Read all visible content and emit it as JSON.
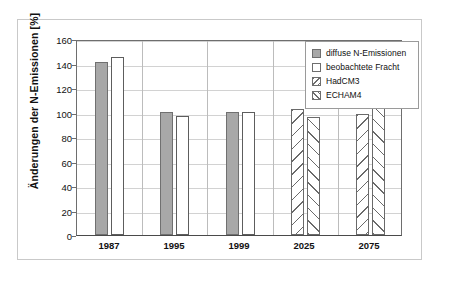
{
  "chart_data": {
    "type": "bar",
    "title": "",
    "xlabel": "",
    "ylabel": "Änderungen der N-Emissionen [%]",
    "categories": [
      "1987",
      "1995",
      "1999",
      "2025",
      "2075"
    ],
    "ylim": [
      0,
      160
    ],
    "yticks": [
      0,
      20,
      40,
      60,
      80,
      100,
      120,
      140,
      160
    ],
    "ytick_labels": [
      "0",
      "20",
      "40",
      "60",
      "80",
      "100",
      "120",
      "140",
      "160"
    ],
    "grid": "horizontal",
    "legend_position": "top-right",
    "series": [
      {
        "name": "diffuse N-Emissionen",
        "style": "solid-gray",
        "color": "#a8a8a8",
        "values": [
          141,
          100,
          100,
          null,
          null
        ]
      },
      {
        "name": "beobachtete Fracht",
        "style": "open-white",
        "color": "#ffffff",
        "values": [
          145,
          97.5,
          100,
          null,
          null
        ]
      },
      {
        "name": "HadCM3",
        "style": "hatch-backslash",
        "color": "#ffffff",
        "values": [
          null,
          null,
          null,
          103,
          98.5
        ]
      },
      {
        "name": "ECHAM4",
        "style": "hatch-forwardslash",
        "color": "#ffffff",
        "values": [
          null,
          null,
          null,
          96,
          104
        ]
      }
    ],
    "bars": [
      {
        "category": "1987",
        "series": "diffuse N-Emissionen",
        "value": 141,
        "style": "solid-gray"
      },
      {
        "category": "1987",
        "series": "beobachtete Fracht",
        "value": 145,
        "style": "open-white"
      },
      {
        "category": "1995",
        "series": "diffuse N-Emissionen",
        "value": 100,
        "style": "solid-gray"
      },
      {
        "category": "1995",
        "series": "beobachtete Fracht",
        "value": 97.5,
        "style": "open-white"
      },
      {
        "category": "1999",
        "series": "diffuse N-Emissionen",
        "value": 100,
        "style": "solid-gray"
      },
      {
        "category": "1999",
        "series": "beobachtete Fracht",
        "value": 100,
        "style": "open-white"
      },
      {
        "category": "2025",
        "series": "HadCM3",
        "value": 103,
        "style": "hatch-backslash"
      },
      {
        "category": "2025",
        "series": "ECHAM4",
        "value": 96,
        "style": "hatch-forwardslash"
      },
      {
        "category": "2075",
        "series": "HadCM3",
        "value": 98.5,
        "style": "hatch-backslash"
      },
      {
        "category": "2075",
        "series": "ECHAM4",
        "value": 104,
        "style": "hatch-forwardslash"
      }
    ]
  },
  "legend": {
    "entries": [
      {
        "label": "diffuse N-Emissionen",
        "swatch": "solid-gray-swatch"
      },
      {
        "label": "beobachtete Fracht",
        "swatch": "open-white-swatch"
      },
      {
        "label": "HadCM3",
        "swatch": "hatch-backslash-swatch"
      },
      {
        "label": "ECHAM4",
        "swatch": "hatch-forwardslash-swatch"
      }
    ]
  },
  "colors": {
    "bar_gray": "#a8a8a8",
    "bar_outline": "#6e6e6e",
    "gridline": "#d2d2d2",
    "axis": "#4a4a4a",
    "frame": "#c9c9c9",
    "background": "#ffffff"
  }
}
